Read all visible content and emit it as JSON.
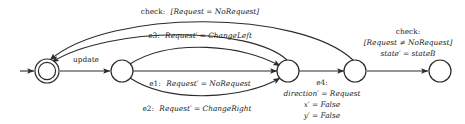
{
  "diagram": {
    "stroke_color": "#2b2b2b",
    "background_color": "#ffffff",
    "nodes": [
      {
        "id": "n1",
        "kind": "initial-accepting-double-circle",
        "label": ""
      },
      {
        "id": "n2",
        "kind": "state-circle",
        "label": ""
      },
      {
        "id": "n3",
        "kind": "state-circle",
        "label": ""
      },
      {
        "id": "n4",
        "kind": "state-circle",
        "label": ""
      },
      {
        "id": "n5",
        "kind": "state-circle",
        "label": ""
      }
    ],
    "labels": {
      "update": "update",
      "check_top": "check: [Request = NoRequest]",
      "e3": "e3: Request′ = ChangeLeft",
      "e1": "e1: Request′ = NoRequest",
      "e2": "e2: Request′ = ChangeRight",
      "e4_line1": "e4:",
      "e4_line2": "direction′ = Request",
      "e4_line3": "x′ = False",
      "e4_line4": "y′ = False",
      "check_right_line1": "check:",
      "check_right_line2": "[Request ≠ NoRequest]",
      "check_right_line3": "state′ = stateB"
    },
    "label_parts": {
      "check_top_prefix": "check:",
      "check_top_guard": "[Request = NoRequest]",
      "e3_prefix": "e3:",
      "e3_action": "Request′ = ChangeLeft",
      "e1_prefix": "e1:",
      "e1_action": "Request′ = NoRequest",
      "e2_prefix": "e2:",
      "e2_action": "Request′ = ChangeRight"
    }
  }
}
